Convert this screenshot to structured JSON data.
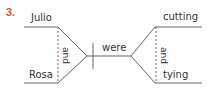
{
  "item_number": "3.",
  "colors": {
    "number": "#e0572a",
    "line": "#666666",
    "text": "#333333"
  },
  "diagram": {
    "type": "sentence-diagram",
    "subjects": [
      "Julio",
      "Rosa"
    ],
    "subject_conjunction": "and",
    "verb": "were",
    "participles": [
      "cutting",
      "tying"
    ],
    "participle_conjunction": "and"
  }
}
